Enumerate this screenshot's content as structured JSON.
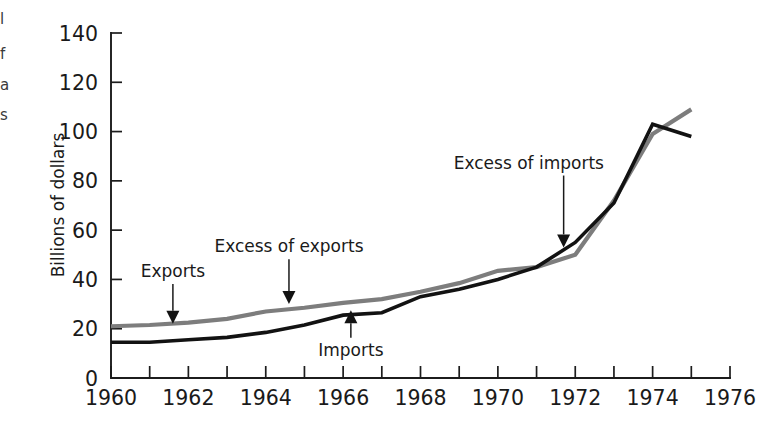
{
  "chart_data": {
    "type": "line",
    "title": "",
    "xlabel": "",
    "ylabel": "Billions of dollars",
    "xlim": [
      1960,
      1976
    ],
    "ylim": [
      0,
      140
    ],
    "grid": false,
    "legend": "none (inline annotations with arrows)",
    "x": [
      1960,
      1961,
      1962,
      1963,
      1964,
      1965,
      1966,
      1967,
      1968,
      1969,
      1970,
      1971,
      1972,
      1973,
      1974,
      1975
    ],
    "series": [
      {
        "name": "Exports",
        "color": "#7d7d7d",
        "values": [
          21,
          21.5,
          22.5,
          24,
          27,
          28.5,
          30.5,
          32,
          35,
          38.5,
          43.5,
          45,
          50,
          72,
          99,
          109
        ]
      },
      {
        "name": "Imports",
        "color": "#121212",
        "values": [
          14.5,
          14.5,
          15.5,
          16.5,
          18.5,
          21.5,
          25.5,
          26.5,
          33,
          36,
          40,
          45,
          55,
          71,
          103,
          98
        ]
      }
    ],
    "x_tick_labels": [
      "1960",
      "1962",
      "1964",
      "1966",
      "1968",
      "1970",
      "1972",
      "1974",
      "1976"
    ],
    "x_tick_step_minor": 1,
    "y_tick_labels": [
      "0",
      "20",
      "40",
      "60",
      "80",
      "100",
      "120",
      "140"
    ],
    "annotations": [
      {
        "id": "exports",
        "text": "Exports",
        "arrow": "down",
        "target_x": 1961.6,
        "target_y": 22.0,
        "text_x": 1961.6,
        "text_y": 41.0
      },
      {
        "id": "excess-of-exports",
        "text": "Excess of exports",
        "arrow": "down",
        "target_x": 1964.6,
        "target_y": 30.0,
        "text_x": 1964.6,
        "text_y": 51.0
      },
      {
        "id": "excess-of-imports",
        "text": "Excess of imports",
        "arrow": "down",
        "target_x": 1971.7,
        "target_y": 53.0,
        "text_x": 1970.8,
        "text_y": 85.0
      },
      {
        "id": "imports",
        "text": "Imports",
        "arrow": "up",
        "target_x": 1966.2,
        "target_y": 27.5,
        "text_x": 1966.2,
        "text_y": 9.0
      }
    ]
  },
  "edge_fragments": {
    "items": [
      {
        "glyph": "l",
        "top": 12
      },
      {
        "glyph": "f",
        "top": 47
      },
      {
        "glyph": "a",
        "top": 78
      },
      {
        "glyph": "s",
        "top": 108
      }
    ]
  },
  "axis_label": {
    "y_title": "Billions of dollars"
  }
}
